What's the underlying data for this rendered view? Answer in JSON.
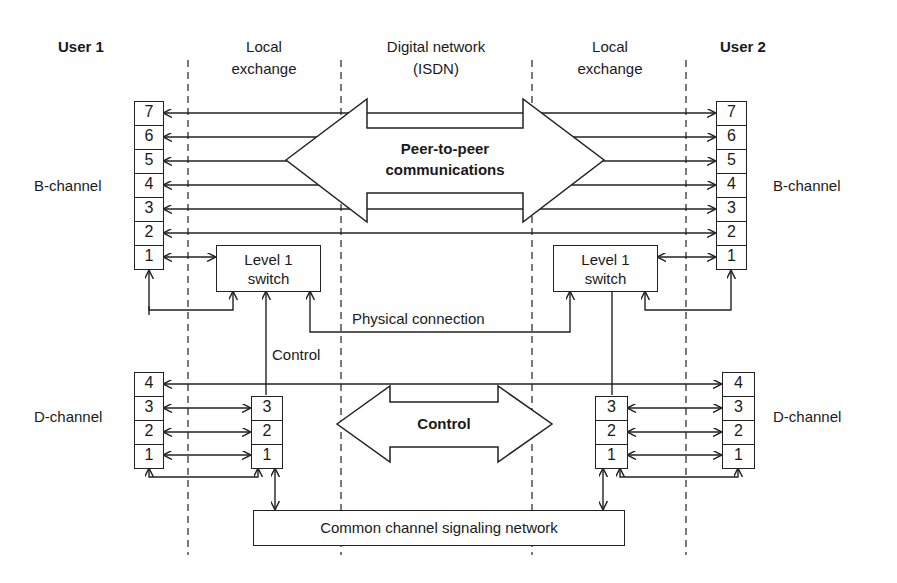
{
  "diagram": {
    "columns": {
      "user1": "User 1",
      "local_exchange_left": [
        "Local",
        "exchange"
      ],
      "digital_network": [
        "Digital network",
        "(ISDN)"
      ],
      "local_exchange_right": [
        "Local",
        "exchange"
      ],
      "user2": "User 2"
    },
    "b_channel": {
      "label_left": "B-channel",
      "label_right": "B-channel",
      "levels": [
        "7",
        "6",
        "5",
        "4",
        "3",
        "2",
        "1"
      ]
    },
    "d_channel": {
      "label_left": "D-channel",
      "label_right": "D-channel",
      "user_levels": [
        "4",
        "3",
        "2",
        "1"
      ],
      "exchange_levels": [
        "3",
        "2",
        "1"
      ]
    },
    "switch_left": [
      "Level 1",
      "switch"
    ],
    "switch_right": [
      "Level 1",
      "switch"
    ],
    "peer_arrow": [
      "Peer-to-peer",
      "communications"
    ],
    "control_arrow": "Control",
    "control_label": "Control",
    "physical_connection": "Physical connection",
    "ccs_network": "Common channel signaling network",
    "colors": {
      "line": "#222222",
      "background": "#ffffff"
    }
  }
}
